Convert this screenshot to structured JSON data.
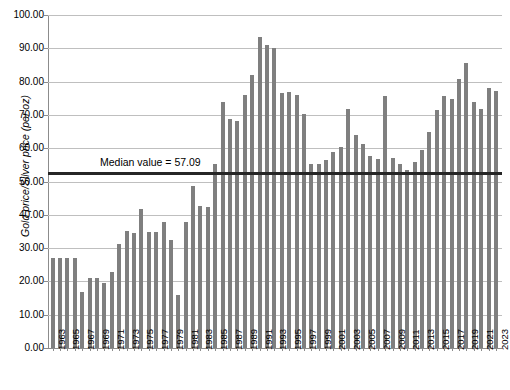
{
  "chart_data": {
    "type": "bar",
    "title": "",
    "xlabel": "",
    "ylabel": "Gold price/Silver price (per oz)",
    "ylim": [
      0,
      100
    ],
    "ytick_step": 10,
    "grid": true,
    "legend": "none",
    "ytick_labels": [
      "0.00",
      "10.00",
      "20.00",
      "30.00",
      "40.00",
      "50.00",
      "60.00",
      "70.00",
      "80.00",
      "90.00",
      "100.00"
    ],
    "xtick_label_step": 2,
    "annotations": [
      {
        "name": "median-line",
        "label": "Median value = 57.09",
        "value": 52.5,
        "color": "#262626"
      }
    ],
    "bar_color": "#7f7f7f",
    "categories": [
      "1963",
      "1964",
      "1965",
      "1966",
      "1967",
      "1968",
      "1969",
      "1970",
      "1971",
      "1972",
      "1973",
      "1974",
      "1975",
      "1976",
      "1977",
      "1978",
      "1979",
      "1980",
      "1981",
      "1982",
      "1983",
      "1984",
      "1985",
      "1986",
      "1987",
      "1988",
      "1989",
      "1990",
      "1991",
      "1992",
      "1993",
      "1994",
      "1995",
      "1996",
      "1997",
      "1998",
      "1999",
      "2000",
      "2001",
      "2002",
      "2003",
      "2004",
      "2005",
      "2006",
      "2007",
      "2008",
      "2009",
      "2010",
      "2011",
      "2012",
      "2013",
      "2014",
      "2015",
      "2016",
      "2017",
      "2018",
      "2019",
      "2020",
      "2021",
      "2022",
      "2023"
    ],
    "values": [
      26.9,
      27.0,
      27.0,
      27.0,
      16.9,
      20.9,
      21.1,
      19.4,
      22.8,
      31.3,
      35.1,
      34.6,
      41.6,
      34.9,
      34.8,
      37.9,
      32.5,
      15.9,
      37.9,
      48.7,
      42.6,
      42.2,
      55.4,
      74.0,
      68.8,
      68.1,
      76.1,
      82.0,
      93.4,
      91.0,
      90.0,
      76.5,
      76.9,
      76.0,
      70.4,
      55.3,
      55.4,
      56.4,
      58.8,
      60.5,
      71.8,
      64.1,
      61.3,
      57.8,
      56.8,
      75.8,
      57.2,
      55.2,
      53.6,
      55.8,
      59.6,
      65.0,
      71.6,
      75.6,
      74.9,
      80.7,
      85.7,
      73.9,
      71.8,
      78.1,
      77.2
    ]
  }
}
